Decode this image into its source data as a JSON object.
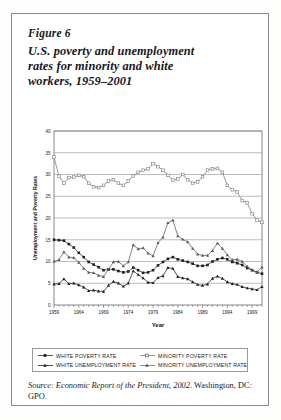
{
  "figure": {
    "label": "Figure 6",
    "title_line1": "U.S. poverty and unemployment",
    "title_line2": "rates for minority and white",
    "title_line3": "workers, 1959–2001"
  },
  "source": {
    "prefix": "Source:",
    "text": "Economic Report of the President, 2002",
    "suffix": ". Washington, DC: GPO."
  },
  "legend": {
    "items": [
      {
        "label": "WHITE POVERTY RATE",
        "marker": "filled-square-line",
        "color": "#2a2a2a"
      },
      {
        "label": "MINORITY POVERTY RATE",
        "marker": "open-square-line",
        "color": "#6e6e6e"
      },
      {
        "label": "WHITE UNEMPLOYMENT RATE",
        "marker": "filled-triangle-line",
        "color": "#2a2a2a"
      },
      {
        "label": "MINORITY UNEMPLOYMENT RATE",
        "marker": "filled-triangle-gray-line",
        "color": "#6e6e6e"
      }
    ]
  },
  "chart_data": {
    "type": "line",
    "title": "",
    "xlabel": "Year",
    "ylabel": "Unemployment and Poverty Rates",
    "xlim": [
      1959,
      2001
    ],
    "ylim": [
      0,
      40
    ],
    "yticks": [
      0,
      5,
      10,
      15,
      20,
      25,
      30,
      35,
      40
    ],
    "xticks": [
      1959,
      1964,
      1969,
      1974,
      1979,
      1984,
      1989,
      1994,
      1999
    ],
    "grid": "horizontal",
    "legend_position": "below-plot",
    "x": [
      1959,
      1960,
      1961,
      1962,
      1963,
      1964,
      1965,
      1966,
      1967,
      1968,
      1969,
      1970,
      1971,
      1972,
      1973,
      1974,
      1975,
      1976,
      1977,
      1978,
      1979,
      1980,
      1981,
      1982,
      1983,
      1984,
      1985,
      1986,
      1987,
      1988,
      1989,
      1990,
      1991,
      1992,
      1993,
      1994,
      1995,
      1996,
      1997,
      1998,
      1999,
      2000,
      2001
    ],
    "series": [
      {
        "name": "MINORITY POVERTY RATE",
        "marker": "open-square",
        "color": "#7a7a7a",
        "values": [
          34.0,
          29.6,
          28.0,
          29.3,
          29.4,
          29.8,
          29.5,
          28.0,
          27.2,
          27.0,
          27.5,
          28.5,
          28.8,
          28.0,
          27.5,
          28.5,
          29.7,
          30.5,
          31.0,
          31.3,
          32.5,
          31.8,
          31.0,
          29.8,
          28.7,
          29.0,
          30.0,
          28.8,
          28.0,
          28.3,
          29.5,
          31.0,
          31.3,
          31.4,
          30.5,
          27.5,
          26.5,
          26.0,
          24.0,
          23.5,
          21.0,
          19.5,
          19.0
        ]
      },
      {
        "name": "WHITE POVERTY RATE",
        "marker": "filled-square",
        "color": "#1f1f1f",
        "values": [
          15.0,
          14.9,
          14.8,
          14.0,
          13.2,
          12.0,
          11.0,
          9.9,
          9.3,
          8.7,
          8.0,
          8.2,
          8.2,
          7.8,
          7.5,
          7.7,
          8.6,
          8.0,
          7.4,
          7.5,
          8.0,
          9.1,
          9.9,
          10.6,
          11.0,
          10.5,
          10.2,
          9.9,
          9.5,
          9.0,
          9.0,
          9.2,
          10.0,
          10.5,
          10.8,
          10.5,
          9.9,
          9.6,
          9.2,
          8.5,
          8.0,
          7.5,
          7.2
        ]
      },
      {
        "name": "MINORITY UNEMPLOYMENT RATE",
        "marker": "filled-triangle-gray",
        "color": "#5a5a5a",
        "values": [
          10.0,
          10.4,
          12.2,
          11.0,
          10.9,
          9.8,
          8.4,
          7.5,
          7.4,
          6.8,
          6.5,
          8.2,
          9.9,
          10.0,
          9.0,
          9.9,
          13.8,
          12.9,
          13.1,
          11.9,
          11.3,
          14.3,
          15.6,
          18.9,
          19.5,
          15.9,
          15.1,
          14.5,
          13.0,
          11.7,
          11.4,
          11.4,
          12.5,
          14.2,
          13.0,
          11.5,
          10.4,
          10.5,
          10.0,
          8.9,
          8.0,
          7.6,
          8.7
        ]
      },
      {
        "name": "WHITE UNEMPLOYMENT RATE",
        "marker": "filled-triangle",
        "color": "#1f1f1f",
        "values": [
          4.8,
          4.9,
          6.0,
          4.9,
          5.0,
          4.6,
          4.1,
          3.3,
          3.4,
          3.2,
          3.1,
          4.5,
          5.4,
          5.0,
          4.3,
          5.0,
          7.8,
          7.0,
          6.2,
          5.2,
          5.1,
          6.3,
          6.7,
          8.6,
          8.4,
          6.5,
          6.2,
          6.0,
          5.3,
          4.7,
          4.5,
          4.8,
          6.1,
          6.6,
          6.1,
          5.3,
          4.9,
          4.7,
          4.2,
          3.9,
          3.7,
          3.5,
          4.2
        ]
      }
    ]
  }
}
